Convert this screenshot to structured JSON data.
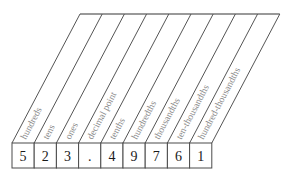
{
  "diagram": {
    "type": "place-value-chart",
    "number": "523.49761",
    "geometry": {
      "slant_top_left_x": 80,
      "slant_top_y": 14,
      "slant_bottom_left_x": 12,
      "slant_bottom_y": 143,
      "box_top_y": 143,
      "box_bottom_y": 168,
      "box_width": 22.2,
      "column_count": 9
    },
    "colors": {
      "label": "#8a8a8a",
      "digit": "#1a1a1a",
      "line": "#555555",
      "top_line": "#777777",
      "background": "#ffffff"
    },
    "columns": [
      {
        "label": "hundreds",
        "digit": "5"
      },
      {
        "label": "tens",
        "digit": "2"
      },
      {
        "label": "ones",
        "digit": "3"
      },
      {
        "label": "decimal point",
        "digit": "."
      },
      {
        "label": "tenths",
        "digit": "4"
      },
      {
        "label": "hundredths",
        "digit": "9"
      },
      {
        "label": "thousandths",
        "digit": "7"
      },
      {
        "label": "ten-thousandths",
        "digit": "6"
      },
      {
        "label": "hundred-thousandths",
        "digit": "1"
      }
    ]
  }
}
